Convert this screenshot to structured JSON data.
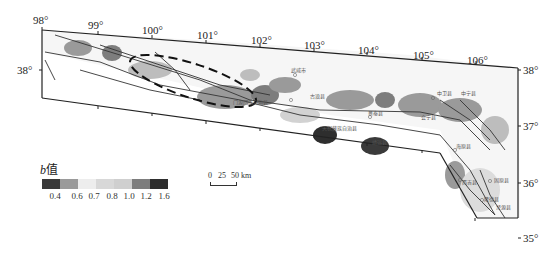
{
  "map": {
    "type": "b-value contour map",
    "lon_ticks": [
      "98°",
      "99°",
      "100°",
      "101°",
      "102°",
      "103°",
      "104°",
      "105°",
      "106°"
    ],
    "lat_ticks": [
      "38°",
      "37°",
      "36°",
      "35°"
    ],
    "left_lat_label": "38°"
  },
  "legend": {
    "title_italic": "b",
    "title_cn": "值",
    "colors": [
      "#3a3a3a",
      "#9a9a9a",
      "#ededed",
      "#d8d8d8",
      "#cfcfcf",
      "#7d7d7d",
      "#2e2e2e"
    ],
    "labels": [
      "0.4",
      "0.6",
      "0.7",
      "0.8",
      "1.0",
      "1.2",
      "1.6"
    ]
  },
  "scale_bar": {
    "labels": [
      "0",
      "25",
      "50 km"
    ]
  },
  "places": [
    {
      "name": "武威市"
    },
    {
      "name": "古浪县"
    },
    {
      "name": "天祝藏族自治县"
    },
    {
      "name": "景泰县"
    },
    {
      "name": "中卫县"
    },
    {
      "name": "中宁县"
    },
    {
      "name": "海原县"
    },
    {
      "name": "靖远县"
    },
    {
      "name": "西吉县"
    },
    {
      "name": "固原县"
    },
    {
      "name": "隆德县"
    },
    {
      "name": "泾源县"
    },
    {
      "name": "门源回族自治县"
    },
    {
      "name": "会宁县"
    }
  ]
}
